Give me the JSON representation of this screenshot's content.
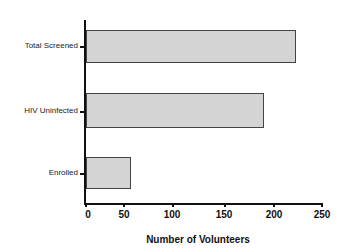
{
  "chart_data": {
    "type": "bar",
    "orientation": "horizontal",
    "title": "",
    "xlabel": "Number of Volunteers",
    "ylabel": "",
    "categories": [
      "Total Screened",
      "HIV Uninfected",
      "Enrolled"
    ],
    "values": [
      224,
      190,
      49
    ],
    "xlim": [
      0,
      250
    ],
    "xticks": [
      "0",
      "50",
      "100",
      "150",
      "200",
      "250"
    ],
    "grid": false,
    "legend": null,
    "bar_color": "#d4d4d4"
  },
  "labels": {
    "bar0": "Total Screened",
    "bar1": "HIV Uninfected",
    "bar2": "Enrolled",
    "tick0": "0",
    "tick1": "50",
    "tick2": "100",
    "tick3": "150",
    "tick4": "200",
    "tick5": "250",
    "x_axis_title": "Number of Volunteers"
  }
}
